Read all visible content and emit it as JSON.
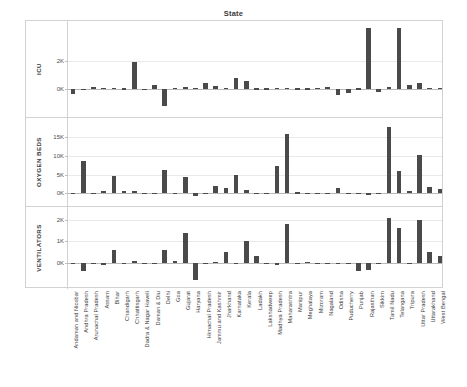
{
  "chart_data": {
    "type": "bar",
    "title": "State",
    "xlabel": "",
    "ylabel": "",
    "grid": true,
    "legend": false,
    "orientation": "vertical",
    "bar_color": "#4a4a4a",
    "categories": [
      "Andaman and Nicobar",
      "Andhra Pradesh",
      "Arunachal Pradesh",
      "Assam",
      "Bihar",
      "Chandigarh",
      "Chhattisgarh",
      "Dadra & Nagar Haveli",
      "Daman & Diu",
      "Delhi",
      "Goa",
      "Gujarat",
      "Haryana",
      "Himachal Pradesh",
      "Jammu and Kashmir",
      "Jharkhand",
      "Karnataka",
      "Kerala",
      "Ladakh",
      "Lakshadweep",
      "Madhya Pradesh",
      "Maharashtra",
      "Manipur",
      "Meghalaya",
      "Mizoram",
      "Nagaland",
      "Odisha",
      "Puducherry",
      "Punjab",
      "Rajasthan",
      "Sikkim",
      "Tamil Nadu",
      "Telangana",
      "Tripura",
      "Uttar Pradesh",
      "Uttarakhand",
      "West Bengal"
    ],
    "panels": [
      {
        "name": "ICU",
        "ylabel": "ICU",
        "yticks": [
          0,
          2000
        ],
        "ytick_labels": [
          "0K",
          "2K"
        ],
        "ylim": [
          -1600,
          4400
        ],
        "values": [
          -370,
          -60,
          120,
          60,
          30,
          20,
          1900,
          -50,
          230,
          -1250,
          30,
          110,
          60,
          380,
          160,
          40,
          760,
          530,
          20,
          20,
          30,
          30,
          20,
          20,
          60,
          90,
          -480,
          -330,
          20,
          4300,
          -250,
          120,
          4300,
          240,
          400,
          30,
          30
        ]
      },
      {
        "name": "OXYGEN BEDS",
        "ylabel": "OXYGEN BEDS",
        "yticks": [
          0,
          5000,
          10000,
          15000
        ],
        "ytick_labels": [
          "0K",
          "5K",
          "10K",
          "15K"
        ],
        "ylim": [
          -1800,
          18500
        ],
        "values": [
          60,
          8500,
          80,
          700,
          4600,
          500,
          550,
          120,
          60,
          6100,
          -180,
          4400,
          -700,
          80,
          2000,
          1400,
          4900,
          900,
          60,
          60,
          7300,
          15900,
          250,
          120,
          120,
          120,
          1300,
          60,
          120,
          -600,
          120,
          17600,
          5900,
          600,
          10300,
          1800,
          1200
        ]
      },
      {
        "name": "VENTILATORS",
        "ylabel": "VENTILATORS",
        "yticks": [
          0,
          1000,
          2000
        ],
        "ytick_labels": [
          "0K",
          "1K",
          "2K"
        ],
        "ylim": [
          -900,
          2300
        ],
        "values": [
          20,
          -330,
          20,
          -40,
          620,
          20,
          120,
          20,
          20,
          620,
          110,
          1400,
          -750,
          20,
          60,
          500,
          20,
          1000,
          330,
          20,
          -60,
          1800,
          20,
          80,
          20,
          20,
          20,
          20,
          -330,
          -300,
          20,
          2050,
          1600,
          20,
          2000,
          500,
          320
        ]
      }
    ]
  }
}
